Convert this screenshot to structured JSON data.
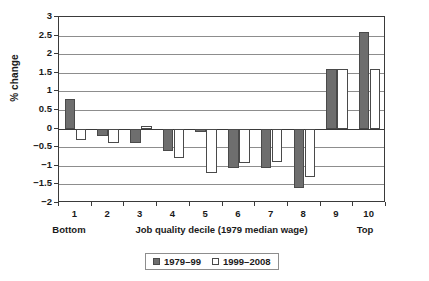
{
  "chart_data": {
    "type": "bar",
    "title": "",
    "xlabel": "Job quality decile (1979 median wage)",
    "ylabel": "% change",
    "ylim": [
      -2,
      3
    ],
    "ytick_step": 0.5,
    "grid": true,
    "legend_position": "bottom",
    "categories": [
      "1",
      "2",
      "3",
      "4",
      "5",
      "6",
      "7",
      "8",
      "9",
      "10"
    ],
    "category_end_labels": {
      "left": "Bottom",
      "right": "Top"
    },
    "yticks": [
      "3",
      "2.5",
      "2",
      "1.5",
      "1",
      "0.5",
      "0",
      "-0.5",
      "-1",
      "-1.5",
      "-2"
    ],
    "ytick_values": [
      3,
      2.5,
      2,
      1.5,
      1,
      0.5,
      0,
      -0.5,
      -1,
      -1.5,
      -2
    ],
    "series": [
      {
        "name": "1979–99",
        "color": "#6e6e6e",
        "values": [
          0.8,
          -0.2,
          -0.4,
          -0.6,
          -0.1,
          -1.07,
          -1.05,
          -1.6,
          1.6,
          2.6
        ]
      },
      {
        "name": "1999–2008",
        "color": "#ffffff",
        "values": [
          -0.3,
          -0.4,
          0.08,
          -0.8,
          -1.2,
          -0.92,
          -0.9,
          -1.3,
          1.6,
          1.6
        ]
      }
    ]
  },
  "legend": {
    "items": [
      {
        "label": "1979–99",
        "swatch": "filled-square-icon"
      },
      {
        "label": "1999–2008",
        "swatch": "open-square-icon"
      }
    ]
  }
}
